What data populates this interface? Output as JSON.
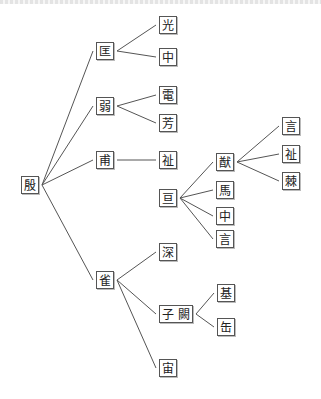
{
  "diagram": {
    "type": "tree",
    "nodes": [
      {
        "id": "n0",
        "label": "殷",
        "x": 21,
        "y": 176
      },
      {
        "id": "n1",
        "label": "匡",
        "x": 96,
        "y": 42
      },
      {
        "id": "n2",
        "label": "光",
        "x": 159,
        "y": 16
      },
      {
        "id": "n3",
        "label": "中",
        "x": 159,
        "y": 48
      },
      {
        "id": "n4",
        "label": "弱",
        "x": 96,
        "y": 97
      },
      {
        "id": "n5",
        "label": "電",
        "x": 159,
        "y": 86
      },
      {
        "id": "n6",
        "label": "芳",
        "x": 159,
        "y": 114
      },
      {
        "id": "n7",
        "label": "甫",
        "x": 96,
        "y": 151
      },
      {
        "id": "n8",
        "label": "祉",
        "x": 159,
        "y": 151
      },
      {
        "id": "n9",
        "label": "亘",
        "x": 159,
        "y": 189
      },
      {
        "id": "n10",
        "label": "猷",
        "x": 216,
        "y": 153
      },
      {
        "id": "n11",
        "label": "言",
        "x": 282,
        "y": 117
      },
      {
        "id": "n12",
        "label": "祉",
        "x": 282,
        "y": 145
      },
      {
        "id": "n13",
        "label": "棘",
        "x": 282,
        "y": 172
      },
      {
        "id": "n14",
        "label": "馬",
        "x": 216,
        "y": 181
      },
      {
        "id": "n15",
        "label": "中",
        "x": 216,
        "y": 207
      },
      {
        "id": "n16",
        "label": "言",
        "x": 216,
        "y": 230
      },
      {
        "id": "n17",
        "label": "雀",
        "x": 96,
        "y": 271
      },
      {
        "id": "n18",
        "label": "深",
        "x": 159,
        "y": 243
      },
      {
        "id": "n19",
        "label": "子 闕",
        "x": 159,
        "y": 305
      },
      {
        "id": "n20",
        "label": "基",
        "x": 217,
        "y": 284
      },
      {
        "id": "n21",
        "label": "缶",
        "x": 217,
        "y": 318
      },
      {
        "id": "n22",
        "label": "宙",
        "x": 159,
        "y": 359
      }
    ],
    "edges": [
      [
        "n0",
        "n1"
      ],
      [
        "n1",
        "n2"
      ],
      [
        "n1",
        "n3"
      ],
      [
        "n0",
        "n4"
      ],
      [
        "n4",
        "n5"
      ],
      [
        "n4",
        "n6"
      ],
      [
        "n0",
        "n7"
      ],
      [
        "n7",
        "n8"
      ],
      [
        "n9",
        "n10"
      ],
      [
        "n10",
        "n11"
      ],
      [
        "n10",
        "n12"
      ],
      [
        "n10",
        "n13"
      ],
      [
        "n9",
        "n14"
      ],
      [
        "n9",
        "n15"
      ],
      [
        "n9",
        "n16"
      ],
      [
        "n0",
        "n17"
      ],
      [
        "n17",
        "n18"
      ],
      [
        "n17",
        "n19"
      ],
      [
        "n19",
        "n20"
      ],
      [
        "n19",
        "n21"
      ],
      [
        "n17",
        "n22"
      ]
    ],
    "colors": {
      "line": "#555555",
      "box_border": "#555555",
      "text": "#222222",
      "background": "#ffffff"
    }
  }
}
